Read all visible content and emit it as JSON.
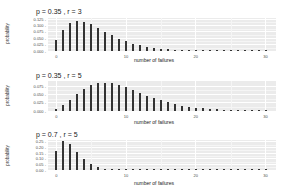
{
  "chart_data": [
    {
      "type": "bar",
      "title": "p = 0.35 , r = 3",
      "xlabel": "number of failures",
      "ylabel": "probability",
      "xlim": [
        -1.2,
        31.5
      ],
      "ylim": [
        0,
        0.13
      ],
      "xticks": [
        "0",
        "10",
        "20",
        "30"
      ],
      "yticks": [
        "0.000",
        "0.025",
        "0.050",
        "0.075",
        "0.100",
        "0.125"
      ],
      "grid": true,
      "x": [
        0,
        1,
        2,
        3,
        4,
        5,
        6,
        7,
        8,
        9,
        10,
        11,
        12,
        13,
        14,
        15,
        16,
        17,
        18,
        19,
        20,
        21,
        22,
        23,
        24,
        25,
        26,
        27,
        28,
        29,
        30
      ],
      "values": [
        0.0429,
        0.0836,
        0.1087,
        0.1178,
        0.1148,
        0.1045,
        0.0906,
        0.0757,
        0.0615,
        0.0488,
        0.038,
        0.0292,
        0.0221,
        0.0165,
        0.0122,
        0.0089,
        0.0065,
        0.0047,
        0.0033,
        0.0024,
        0.0017,
        0.0012,
        0.0008,
        0.0006,
        0.0004,
        0.0003,
        0.0002,
        0.0001,
        0.0001,
        0.0001,
        0.0
      ]
    },
    {
      "type": "bar",
      "title": "p = 0.35 , r = 5",
      "xlabel": "number of failures",
      "ylabel": "probability",
      "xlim": [
        -1.2,
        31.5
      ],
      "ylim": [
        0,
        0.09
      ],
      "xticks": [
        "0",
        "10",
        "20",
        "30"
      ],
      "yticks": [
        "0.000",
        "0.025",
        "0.050",
        "0.075"
      ],
      "grid": true,
      "x": [
        0,
        1,
        2,
        3,
        4,
        5,
        6,
        7,
        8,
        9,
        10,
        11,
        12,
        13,
        14,
        15,
        16,
        17,
        18,
        19,
        20,
        21,
        22,
        23,
        24,
        25,
        26,
        27,
        28,
        29,
        30
      ],
      "values": [
        0.0053,
        0.0171,
        0.0334,
        0.0507,
        0.0659,
        0.0771,
        0.0835,
        0.0853,
        0.0832,
        0.0781,
        0.0711,
        0.063,
        0.0546,
        0.0464,
        0.0388,
        0.0319,
        0.0259,
        0.0208,
        0.0165,
        0.013,
        0.0101,
        0.0078,
        0.006,
        0.0046,
        0.0035,
        0.0026,
        0.002,
        0.0015,
        0.0011,
        0.0008,
        0.0006
      ]
    },
    {
      "type": "bar",
      "title": "p = 0.7 , r = 5",
      "xlabel": "number of failures",
      "ylabel": "probability",
      "xlim": [
        -1.2,
        31.5
      ],
      "ylim": [
        0,
        0.265
      ],
      "xticks": [
        "0",
        "10",
        "20",
        "30"
      ],
      "yticks": [
        "0.00",
        "0.05",
        "0.10",
        "0.15",
        "0.20",
        "0.25"
      ],
      "grid": true,
      "x": [
        0,
        1,
        2,
        3,
        4,
        5,
        6,
        7,
        8,
        9,
        10,
        11,
        12,
        13,
        14,
        15,
        16,
        17,
        18,
        19,
        20,
        21,
        22,
        23,
        24,
        25,
        26,
        27,
        28,
        29,
        30
      ],
      "values": [
        0.1681,
        0.2521,
        0.2269,
        0.1588,
        0.0953,
        0.0515,
        0.0257,
        0.0121,
        0.0054,
        0.0023,
        0.001,
        0.0004,
        0.0002,
        0.0001,
        0.0,
        0.0,
        0.0,
        0.0,
        0.0,
        0.0,
        0.0,
        0.0,
        0.0,
        0.0,
        0.0,
        0.0,
        0.0,
        0.0,
        0.0,
        0.0,
        0.0
      ]
    }
  ],
  "panels": [
    {
      "title": "p = 0.35 , r = 3",
      "ylabel": "probability",
      "xlabel": "number of failures"
    },
    {
      "title": "p = 0.35 , r = 5",
      "ylabel": "probability",
      "xlabel": "number of failures"
    },
    {
      "title": "p = 0.7 , r = 5",
      "ylabel": "probability",
      "xlabel": "number of failures"
    }
  ]
}
